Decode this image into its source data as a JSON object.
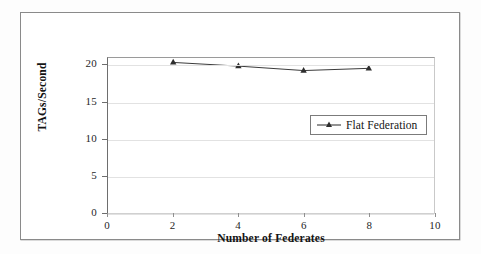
{
  "chart_data": {
    "type": "line",
    "title": "",
    "xlabel": "Number of Federates",
    "ylabel": "TAGs/Second",
    "x": [
      2,
      4,
      6,
      8
    ],
    "xlim": [
      0,
      10
    ],
    "ylim": [
      0,
      21
    ],
    "xticks": [
      "0",
      "2",
      "4",
      "6",
      "8",
      "10"
    ],
    "yticks": [
      "0",
      "5",
      "10",
      "15",
      "20"
    ],
    "xtick_values": [
      0,
      2,
      4,
      6,
      8,
      10
    ],
    "ytick_values": [
      0,
      5,
      10,
      15,
      20
    ],
    "grid": "horizontal",
    "legend_position": "center-right-inside",
    "series": [
      {
        "name": "Flat Federation",
        "values": [
          20.4,
          19.9,
          19.3,
          19.6
        ],
        "marker": "triangle",
        "color": "#3b3b3b"
      }
    ]
  },
  "legend": {
    "entries": [
      {
        "label": "Flat Federation",
        "color": "#3b3b3b"
      }
    ]
  },
  "axes": {
    "x_title": "Number of Federates",
    "y_title": "TAGs/Second"
  },
  "colors": {
    "line": "#3b3b3b",
    "grid": "#e2e2e2",
    "axis": "#6e6e6e",
    "frame": "#8a8a8a",
    "text": "#141414"
  }
}
